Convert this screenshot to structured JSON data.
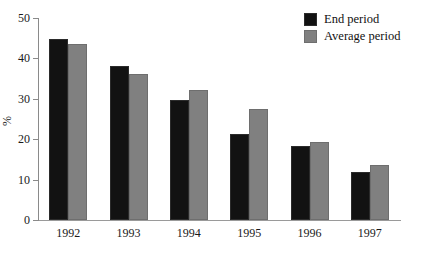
{
  "chart_data": {
    "type": "bar",
    "title": "",
    "subtitle": "",
    "xlabel": "",
    "ylabel": "%",
    "categories": [
      "1992",
      "1993",
      "1994",
      "1995",
      "1996",
      "1997"
    ],
    "series": [
      {
        "name": "End period",
        "color": "#121212",
        "values": [
          44.7,
          38.2,
          29.6,
          21.3,
          18.4,
          11.9
        ]
      },
      {
        "name": "Average period",
        "color": "#808080",
        "values": [
          43.6,
          36.2,
          32.3,
          27.6,
          19.4,
          13.5
        ]
      }
    ],
    "ylim": [
      0,
      50
    ],
    "yticks": [
      0,
      10,
      20,
      30,
      40,
      50
    ],
    "ytick_labels": [
      "0",
      "10",
      "20",
      "30",
      "40",
      "50"
    ],
    "grid": false,
    "legend_position": "top-right"
  },
  "legend": {
    "items": [
      {
        "label": "End period",
        "swatch": "black-swatch"
      },
      {
        "label": "Average period",
        "swatch": "gray-swatch"
      }
    ]
  }
}
